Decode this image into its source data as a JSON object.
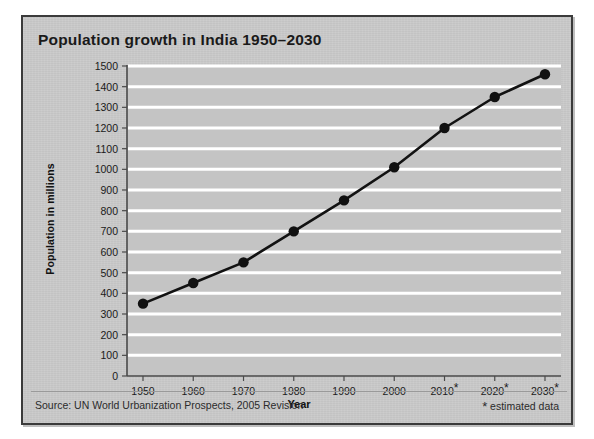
{
  "card": {
    "title": "Population growth in India 1950–2030",
    "source_note": "Source: UN World Urbanization Prospects, 2005 Revision",
    "estimate_note": "estimated data",
    "estimate_marker": "*"
  },
  "colors": {
    "card_background": "#c9c9c9",
    "card_border": "#3b3b3b",
    "plot_background": "#c4c4c4",
    "gridline": "#ffffff",
    "line": "#121212",
    "marker": "#111111",
    "axis": "#4a4a4a",
    "text": "#1a1a1a"
  },
  "chart_data": {
    "type": "line",
    "title": "Population growth in India 1950–2030",
    "xlabel": "Year",
    "ylabel": "Population in millions",
    "categories": [
      "1950",
      "1960",
      "1970",
      "1980",
      "1990",
      "2000",
      "2010*",
      "2020*",
      "2030*"
    ],
    "x": [
      1950,
      1960,
      1970,
      1980,
      1990,
      2000,
      2010,
      2020,
      2030
    ],
    "values": [
      350,
      450,
      550,
      700,
      850,
      1010,
      1200,
      1350,
      1460
    ],
    "series": [
      {
        "name": "Population in millions",
        "values": [
          350,
          450,
          550,
          700,
          850,
          1010,
          1200,
          1350,
          1460
        ]
      }
    ],
    "estimated_points": [
      "2010*",
      "2020*",
      "2030*"
    ],
    "ylim": [
      0,
      1500
    ],
    "ytick_step": 100,
    "yticks": [
      0,
      100,
      200,
      300,
      400,
      500,
      600,
      700,
      800,
      900,
      1000,
      1100,
      1200,
      1300,
      1400,
      1500
    ],
    "ytick_labels": [
      "0",
      "100",
      "200",
      "300",
      "400",
      "500",
      "600",
      "700",
      "800",
      "900",
      "1000",
      "1100",
      "1200",
      "1300",
      "1400",
      "1500"
    ],
    "grid": "horizontal",
    "legend": "none",
    "marker_style": "filled-circle",
    "annotations": [
      "Source: UN World Urbanization Prospects, 2005 Revision",
      "* estimated data"
    ]
  }
}
